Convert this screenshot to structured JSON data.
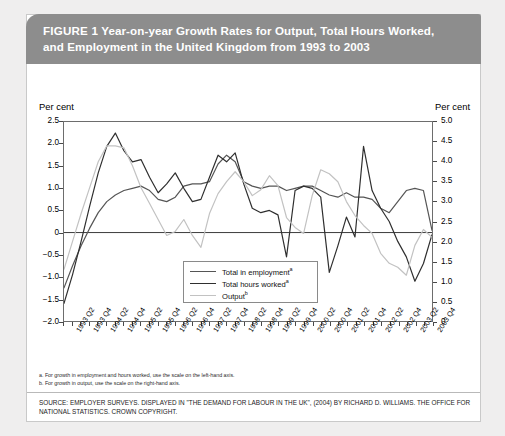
{
  "figure": {
    "label": "FIGURE 1",
    "title_line_1": "Year-on-year Growth Rates for Output, Total Hours Worked,",
    "title_line_2": "and Employment in the United Kingdom from 1993 to 2003"
  },
  "axis_unit_left": "Per cent",
  "axis_unit_right": "Per cent",
  "footnotes": [
    "a. For growth in employment and hours worked, use the scale on the left-hand axis.",
    "b. For growth in output, use the scale on the right-hand axis."
  ],
  "source": "SOURCE: EMPLOYER SURVEYS. DISPLAYED IN \"THE DEMAND FOR LABOUR IN THE UK\", (2004) BY RICHARD D. WILLIAMS. THE OFFICE FOR NATIONAL STATISTICS. CROWN COPYRIGHT.",
  "colors": {
    "header_band": "#8d8d8d",
    "page_background": "#efeeee",
    "card_background": "#ffffff",
    "employment_line": "#555555",
    "hours_line": "#2f2f2f",
    "output_line": "#c2c2c2",
    "axis": "#6d6d6d"
  },
  "chart_data": {
    "type": "line",
    "title": "Year-on-year Growth Rates for Output, Total Hours Worked, and Employment in the United Kingdom from 1993 to 2003",
    "xlabel": "",
    "ylabel": "Per cent",
    "y2label": "Per cent",
    "ylim": [
      -2.0,
      2.5
    ],
    "y2lim": [
      0,
      5.0
    ],
    "yticks": [
      "-2.0",
      "-1.5",
      "-1.0",
      "-0.5",
      "0",
      "0.5",
      "1.0",
      "1.5",
      "2.0",
      "2.5"
    ],
    "y2ticks": [
      "0",
      "0.5",
      "1.0",
      "1.5",
      "2.0",
      "2.5",
      "3.0",
      "3.5",
      "4.0",
      "4.5",
      "5.0"
    ],
    "grid": false,
    "legend_position": "inside-bottom-center",
    "x": [
      "1993 Q1",
      "1993 Q2",
      "1993 Q3",
      "1993 Q4",
      "1994 Q1",
      "1994 Q2",
      "1994 Q3",
      "1994 Q4",
      "1995 Q1",
      "1995 Q2",
      "1995 Q3",
      "1995 Q4",
      "1996 Q1",
      "1996 Q2",
      "1996 Q3",
      "1996 Q4",
      "1997 Q1",
      "1997 Q2",
      "1997 Q3",
      "1997 Q4",
      "1998 Q1",
      "1998 Q2",
      "1998 Q3",
      "1998 Q4",
      "1999 Q1",
      "1999 Q2",
      "1999 Q3",
      "1999 Q4",
      "2000 Q1",
      "2000 Q2",
      "2000 Q3",
      "2000 Q4",
      "2001 Q1",
      "2001 Q2",
      "2001 Q3",
      "2001 Q4",
      "2002 Q1",
      "2002 Q2",
      "2002 Q3",
      "2002 Q4",
      "2003 Q1",
      "2003 Q2",
      "2003 Q3",
      "2003 Q4"
    ],
    "xtick_labels": [
      "1993 Q2",
      "1993 Q4",
      "1994 Q2",
      "1994 Q4",
      "1995 Q2",
      "1995 Q4",
      "1996 Q2",
      "1996 Q4",
      "1997 Q2",
      "1997 Q4",
      "1998 Q2",
      "1998 Q4",
      "1999 Q2",
      "1999 Q4",
      "2000 Q2",
      "2000 Q4",
      "2001 Q2",
      "2001 Q4",
      "2002 Q2",
      "2002 Q4",
      "2003 Q2",
      "2003 Q4"
    ],
    "series": [
      {
        "name": "Total in employment",
        "footnote_marker": "a",
        "axis": "left",
        "color": "#555555",
        "values": [
          -1.25,
          -0.75,
          -0.3,
          0.1,
          0.45,
          0.7,
          0.85,
          0.95,
          1.0,
          1.05,
          0.95,
          0.75,
          0.7,
          0.8,
          1.05,
          1.1,
          1.1,
          1.15,
          1.55,
          1.75,
          1.6,
          1.15,
          1.05,
          1.0,
          1.05,
          1.05,
          0.95,
          1.0,
          1.05,
          1.05,
          0.95,
          0.85,
          0.8,
          0.9,
          0.8,
          0.8,
          0.75,
          0.55,
          0.45,
          0.7,
          0.95,
          1.0,
          0.95,
          0.05
        ]
      },
      {
        "name": "Total hours worked",
        "footnote_marker": "a",
        "axis": "left",
        "color": "#2f2f2f",
        "values": [
          -1.6,
          -0.95,
          -0.2,
          0.6,
          1.35,
          1.95,
          2.25,
          1.85,
          1.6,
          1.65,
          1.25,
          0.9,
          1.1,
          1.35,
          1.0,
          0.7,
          0.75,
          1.25,
          1.75,
          1.6,
          1.8,
          1.1,
          0.55,
          0.45,
          0.5,
          0.4,
          -0.55,
          0.95,
          1.05,
          1.0,
          0.8,
          -0.9,
          -0.3,
          0.35,
          -0.1,
          1.95,
          0.95,
          0.55,
          0.25,
          -0.2,
          -0.55,
          -1.1,
          -0.7,
          -0.05
        ]
      },
      {
        "name": "Output",
        "footnote_marker": "b",
        "axis": "right",
        "color": "#c2c2c2",
        "values": [
          1.3,
          2.0,
          2.7,
          3.35,
          4.0,
          4.4,
          4.4,
          4.35,
          3.9,
          3.35,
          2.95,
          2.55,
          2.15,
          2.25,
          2.55,
          2.15,
          1.85,
          2.7,
          3.2,
          3.5,
          3.75,
          3.5,
          3.15,
          3.3,
          3.65,
          3.4,
          2.6,
          2.35,
          2.2,
          3.15,
          3.8,
          3.7,
          3.5,
          3.0,
          2.65,
          2.4,
          2.2,
          1.7,
          1.45,
          1.35,
          1.15,
          1.9,
          2.3,
          2.1
        ]
      }
    ]
  }
}
